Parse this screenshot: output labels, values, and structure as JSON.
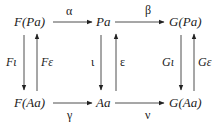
{
  "diagram": {
    "type": "commutative-diagram",
    "nodes": {
      "top_left": "F(Pa)",
      "top_mid": "Pa",
      "top_right": "G(Pa)",
      "bot_left": "F(Aa)",
      "bot_mid": "Aa",
      "bot_right": "G(Aa)"
    },
    "arrows": {
      "alpha": {
        "label": "α",
        "from": "F(Pa)",
        "to": "Pa"
      },
      "beta": {
        "label": "β",
        "from": "Pa",
        "to": "G(Pa)"
      },
      "gamma": {
        "label": "γ",
        "from": "F(Aa)",
        "to": "Aa"
      },
      "nu": {
        "label": "ν",
        "from": "Aa",
        "to": "G(Aa)"
      },
      "F_iota": {
        "label": "Fι",
        "from": "F(Pa)",
        "to": "F(Aa)"
      },
      "F_epsilon": {
        "label": "Fε",
        "from": "F(Aa)",
        "to": "F(Pa)"
      },
      "iota": {
        "label": "ι",
        "from": "Pa",
        "to": "Aa"
      },
      "epsilon": {
        "label": "ε",
        "from": "Aa",
        "to": "Pa"
      },
      "G_iota": {
        "label": "Gι",
        "from": "G(Pa)",
        "to": "G(Aa)"
      },
      "G_epsilon": {
        "label": "Gε",
        "from": "G(Aa)",
        "to": "G(Pa)"
      }
    },
    "colors": {
      "ink": "#222222",
      "background": "#ffffff"
    }
  }
}
